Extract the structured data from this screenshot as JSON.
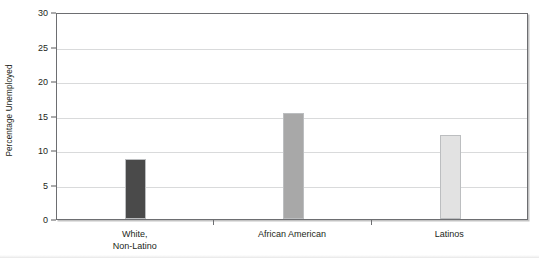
{
  "chart_data": {
    "type": "bar",
    "title": "",
    "subtitle": "",
    "xlabel": "",
    "ylabel": "Percentage Unemployed",
    "categories": [
      "White,\nNon-Latino",
      "African American",
      "Latinos"
    ],
    "values": [
      8.7,
      15.3,
      12.2
    ],
    "ylim": [
      0,
      30
    ],
    "ytick_labels": [
      "0",
      "5",
      "10",
      "15",
      "20",
      "25",
      "30"
    ],
    "ytick_values": [
      0,
      5,
      10,
      15,
      20,
      25,
      30
    ],
    "grid": "horizontal",
    "legend": "none",
    "bar_colors": [
      "#4a4a4a",
      "#a8a8a8",
      "#e2e2e2"
    ],
    "series": [
      {
        "name": "Percentage Unemployed",
        "values": [
          8.7,
          15.3,
          12.2
        ]
      }
    ]
  },
  "axis": {
    "y_title": "Percentage Unemployed"
  },
  "colors": {
    "plot_border": "#6d6e71",
    "gridline": "#d9dadb",
    "text": "#231f20",
    "bar_1": "#4a4a4a",
    "bar_2": "#a8a8a8",
    "bar_3": "#e2e2e2"
  }
}
